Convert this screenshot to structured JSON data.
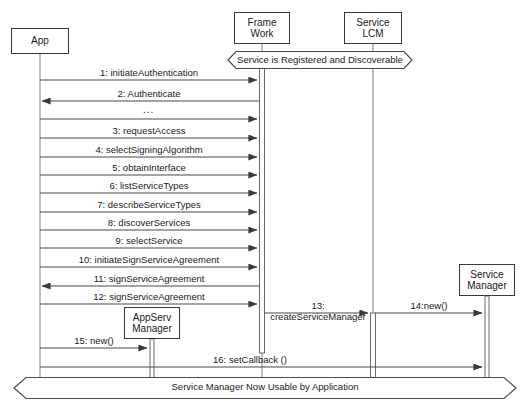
{
  "diagram": {
    "type": "uml-sequence-diagram",
    "width": 528,
    "height": 416,
    "background_color": "#ffffff",
    "line_color": "#3a3a3a",
    "text_color": "#1a1a1a"
  },
  "lifelines": [
    {
      "id": "app",
      "label_lines": [
        "App"
      ],
      "x": 40,
      "box_top": 28,
      "box_width": 58,
      "box_height": 26,
      "lifeline_bottom": 396
    },
    {
      "id": "framework",
      "label_lines": [
        "Frame",
        "Work"
      ],
      "x": 262,
      "box_top": 12,
      "box_width": 56,
      "box_height": 32,
      "lifeline_bottom": 396
    },
    {
      "id": "service_lcm",
      "label_lines": [
        "Service",
        "LCM"
      ],
      "x": 373,
      "box_top": 12,
      "box_width": 58,
      "box_height": 32,
      "lifeline_bottom": 396
    },
    {
      "id": "appserv_mgr",
      "label_lines": [
        "AppServ",
        "Manager"
      ],
      "x": 152,
      "box_top": 307,
      "box_width": 56,
      "box_height": 32,
      "lifeline_bottom": 396
    },
    {
      "id": "service_mgr",
      "label_lines": [
        "Service",
        "Manager"
      ],
      "x": 487,
      "box_top": 264,
      "box_width": 56,
      "box_height": 32,
      "lifeline_bottom": 396
    }
  ],
  "activations": [
    {
      "id": "framework-activation",
      "lifeline": "framework",
      "x": 262,
      "top": 62,
      "bottom": 353,
      "width": 5
    },
    {
      "id": "service-lcm-activation",
      "lifeline": "service_lcm",
      "x": 373,
      "top": 313,
      "bottom": 380,
      "width": 5
    },
    {
      "id": "appserv-activation",
      "lifeline": "appserv_mgr",
      "x": 152,
      "top": 339,
      "bottom": 380,
      "width": 4
    },
    {
      "id": "service-mgr-activation",
      "lifeline": "service_mgr",
      "x": 487,
      "top": 296,
      "bottom": 380,
      "width": 4
    }
  ],
  "messages": [
    {
      "seq": "1",
      "label": "1: initiateAuthentication",
      "from": "app",
      "to": "framework",
      "y": 80,
      "direction": "right"
    },
    {
      "seq": "2",
      "label": "2: Authenticate",
      "from": "framework",
      "to": "app",
      "y": 101,
      "direction": "left"
    },
    {
      "seq": "",
      "label": "",
      "from": "app",
      "to": "framework",
      "y": 119,
      "direction": "right"
    },
    {
      "seq": "3",
      "label": "3: requestAccess",
      "from": "app",
      "to": "framework",
      "y": 138,
      "direction": "right"
    },
    {
      "seq": "4",
      "label": "4: selectSigningAlgorithm",
      "from": "app",
      "to": "framework",
      "y": 157,
      "direction": "right"
    },
    {
      "seq": "5",
      "label": "5: obtainInterface",
      "from": "app",
      "to": "framework",
      "y": 175,
      "direction": "right"
    },
    {
      "seq": "6",
      "label": "6: listServiceTypes",
      "from": "app",
      "to": "framework",
      "y": 193,
      "direction": "right"
    },
    {
      "seq": "7",
      "label": "7: describeServiceTypes",
      "from": "app",
      "to": "framework",
      "y": 212,
      "direction": "right"
    },
    {
      "seq": "8",
      "label": "8: discoverServices",
      "from": "app",
      "to": "framework",
      "y": 230,
      "direction": "right"
    },
    {
      "seq": "9",
      "label": "9: selectService",
      "from": "app",
      "to": "framework",
      "y": 248,
      "direction": "right"
    },
    {
      "seq": "10",
      "label": "10: initiateSignServiceAgreement",
      "from": "app",
      "to": "framework",
      "y": 267,
      "direction": "right"
    },
    {
      "seq": "11",
      "label": "11: signServiceAgreement",
      "from": "framework",
      "to": "app",
      "y": 286,
      "direction": "left"
    },
    {
      "seq": "12",
      "label": "12: signServiceAgreement",
      "from": "app",
      "to": "framework",
      "y": 304,
      "direction": "right"
    },
    {
      "seq": "13",
      "label": "13:\ncreateServiceManager",
      "from": "framework",
      "to": "service_lcm",
      "y": 313,
      "direction": "right"
    },
    {
      "seq": "14",
      "label": "14:new()",
      "from": "service_lcm",
      "to": "service_mgr",
      "y": 313,
      "direction": "right"
    },
    {
      "seq": "15",
      "label": "15: new()",
      "from": "app",
      "to": "appserv_mgr",
      "y": 348,
      "direction": "right"
    },
    {
      "seq": "16",
      "label": "16:  setCallback ()",
      "from": "app",
      "to": "service_mgr",
      "y": 367,
      "direction": "right"
    }
  ],
  "ellipsis_marker": {
    "text": "...",
    "x": 152,
    "y": 110
  },
  "banners": [
    {
      "id": "top-banner",
      "label": "Service is Registered and Discoverable",
      "left": 228,
      "right": 412,
      "center_y": 60,
      "height": 17
    },
    {
      "id": "bottom-banner",
      "label": "Service Manager Now Usable by Application",
      "left": 14,
      "right": 516,
      "center_y": 388,
      "height": 21
    }
  ]
}
